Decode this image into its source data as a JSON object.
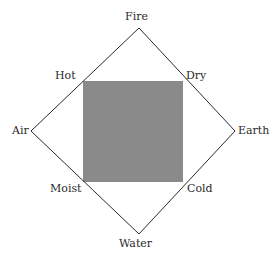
{
  "diagram": {
    "type": "four-elements-qualities",
    "elements": {
      "top": "Fire",
      "left": "Air",
      "right": "Earth",
      "bottom": "Water"
    },
    "qualities": {
      "top_left": "Hot",
      "top_right": "Dry",
      "bottom_left": "Moist",
      "bottom_right": "Cold"
    },
    "colors": {
      "square_fill": "#8a8a8a",
      "line": "#2a2a2a",
      "background": "#ffffff"
    }
  }
}
